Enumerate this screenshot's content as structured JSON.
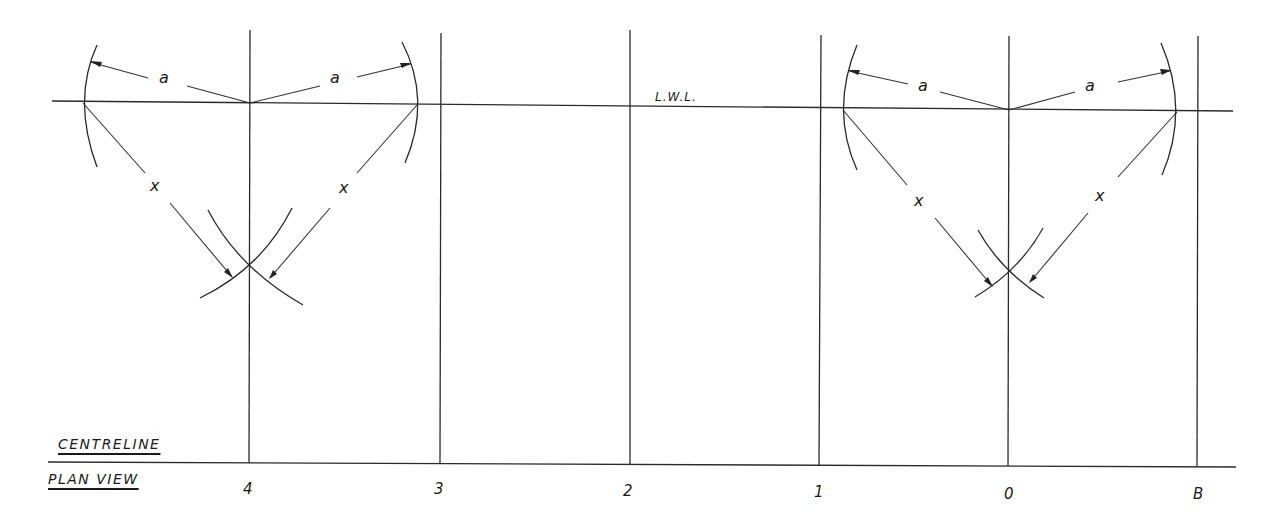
{
  "diagram": {
    "title_top": "CENTRELINE",
    "title_bottom": "PLAN VIEW",
    "waterline_label": "L.W.L.",
    "stations": [
      {
        "label": "4",
        "x": 249
      },
      {
        "label": "3",
        "x": 440
      },
      {
        "label": "2",
        "x": 630
      },
      {
        "label": "1",
        "x": 819
      },
      {
        "label": "0",
        "x": 1009
      },
      {
        "label": "B",
        "x": 1198
      }
    ],
    "dimension_symbols": {
      "radius_a": "a",
      "radius_x": "x"
    },
    "constructions": [
      {
        "name": "left-construction",
        "centre_x": 249,
        "lwl_y": 103,
        "left_x": 83,
        "right_x": 417,
        "intersect_y": 263
      },
      {
        "name": "right-construction",
        "centre_x": 1009,
        "lwl_y": 110,
        "left_x": 843,
        "right_x": 1177,
        "intersect_y": 270
      }
    ],
    "colors": {
      "ink": "#2a2a2a",
      "paper": "#ffffff"
    }
  }
}
